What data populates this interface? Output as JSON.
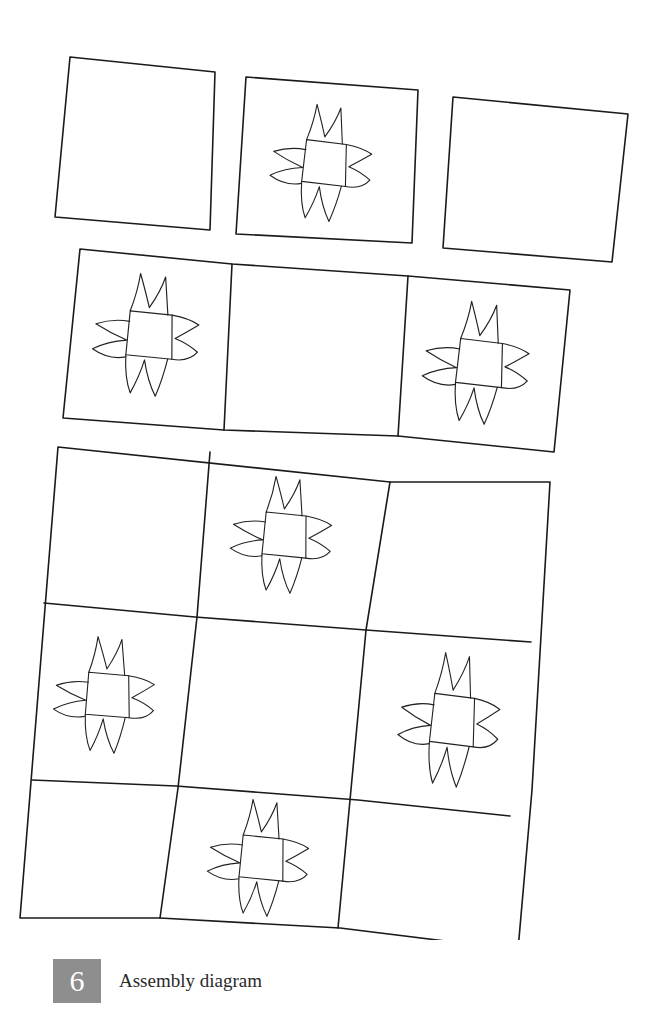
{
  "figure": {
    "number": "6",
    "title": "Assembly diagram"
  },
  "diagram": {
    "rows": [
      {
        "name": "row-1",
        "blocks": [
          "plain",
          "star",
          "plain"
        ]
      },
      {
        "name": "row-2",
        "blocks": [
          "star",
          "plain",
          "star"
        ]
      },
      {
        "name": "panel-row-1",
        "blocks": [
          "plain",
          "star",
          "plain"
        ]
      },
      {
        "name": "panel-row-2",
        "blocks": [
          "star",
          "plain",
          "star"
        ]
      },
      {
        "name": "panel-row-3",
        "blocks": [
          "plain",
          "star",
          "plain"
        ]
      }
    ],
    "colors": {
      "line": "#1a1a1a",
      "background": "#ffffff",
      "badge": "#8e8e8e"
    }
  }
}
